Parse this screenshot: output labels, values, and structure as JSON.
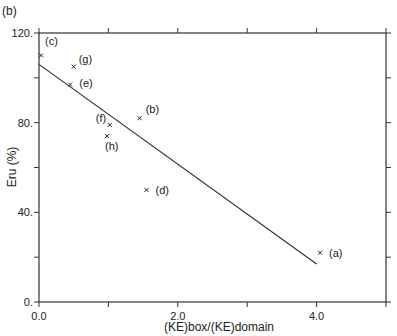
{
  "panel_label": "(b)",
  "chart_data": {
    "type": "scatter",
    "title": "",
    "xlabel": "(KE)box/(KE)domain",
    "ylabel": "Eru (%)",
    "xlim": [
      0,
      5.0
    ],
    "ylim": [
      0,
      120
    ],
    "x_ticks": [
      0.0,
      1.0,
      2.0,
      3.0,
      4.0,
      5.0
    ],
    "x_tick_labels": [
      "0.0",
      "",
      "2.0",
      "",
      "4.0",
      ""
    ],
    "y_ticks": [
      0,
      20,
      40,
      60,
      80,
      100,
      120
    ],
    "y_tick_labels": [
      "0.",
      "",
      "40.",
      "",
      "80.",
      "",
      "120."
    ],
    "grid": false,
    "points": [
      {
        "label": "(a)",
        "x": 4.05,
        "y": 22
      },
      {
        "label": "(b)",
        "x": 1.45,
        "y": 82
      },
      {
        "label": "(c)",
        "x": 0.03,
        "y": 110
      },
      {
        "label": "(d)",
        "x": 1.55,
        "y": 50
      },
      {
        "label": "(e)",
        "x": 0.45,
        "y": 97
      },
      {
        "label": "(f)",
        "x": 1.02,
        "y": 79
      },
      {
        "label": "(g)",
        "x": 0.5,
        "y": 105
      },
      {
        "label": "(h)",
        "x": 0.98,
        "y": 74
      }
    ],
    "fit_line": {
      "x": [
        0.0,
        4.0
      ],
      "y": [
        106,
        17
      ]
    }
  }
}
